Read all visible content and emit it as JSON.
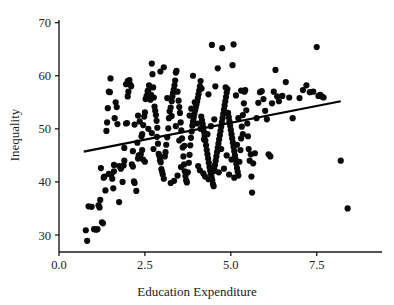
{
  "chart_data": {
    "type": "scatter",
    "title": "",
    "xlabel": "Education Expenditure",
    "ylabel": "Inequality",
    "xlim": [
      0.0,
      9.4
    ],
    "ylim": [
      26.8,
      70.5
    ],
    "xticks": [
      0.0,
      2.5,
      5.0,
      7.5
    ],
    "xticklabels": [
      "0.0",
      "2.5",
      "5.0",
      "7.5"
    ],
    "yticks": [
      30,
      40,
      50,
      60,
      70
    ],
    "yticklabels": [
      "30",
      "40",
      "50",
      "60",
      "70"
    ],
    "grid": false,
    "legend": null,
    "marker": {
      "shape": "circle",
      "color": "#0a0a0a",
      "size": 3.1
    },
    "trendline": {
      "type": "linear-fit",
      "color": "#000000",
      "x_start": 0.72,
      "y_start": 45.7,
      "x_end": 8.2,
      "y_end": 55.2,
      "slope": 1.27,
      "intercept": 44.79
    },
    "n_points": 301,
    "points": [
      [
        0.78,
        30.9
      ],
      [
        0.82,
        28.9
      ],
      [
        0.86,
        35.4
      ],
      [
        0.95,
        35.3
      ],
      [
        1.02,
        31.1
      ],
      [
        1.08,
        31.0
      ],
      [
        1.12,
        31.1
      ],
      [
        1.15,
        35.6
      ],
      [
        1.18,
        35.2
      ],
      [
        1.2,
        36.6
      ],
      [
        1.22,
        42.6
      ],
      [
        1.25,
        32.4
      ],
      [
        1.28,
        32.2
      ],
      [
        1.3,
        40.8
      ],
      [
        1.32,
        41.0
      ],
      [
        1.35,
        38.4
      ],
      [
        1.38,
        49.6
      ],
      [
        1.4,
        51.2
      ],
      [
        1.42,
        53.9
      ],
      [
        1.45,
        57.0
      ],
      [
        1.48,
        56.9
      ],
      [
        1.5,
        59.5
      ],
      [
        1.52,
        41.3
      ],
      [
        1.55,
        40.6
      ],
      [
        1.58,
        38.8
      ],
      [
        1.6,
        43.2
      ],
      [
        1.62,
        52.0
      ],
      [
        1.65,
        55.0
      ],
      [
        1.68,
        54.1
      ],
      [
        1.7,
        50.9
      ],
      [
        1.75,
        36.2
      ],
      [
        1.8,
        42.5
      ],
      [
        1.85,
        40.0
      ],
      [
        1.88,
        43.1
      ],
      [
        1.9,
        46.4
      ],
      [
        1.95,
        51.0
      ],
      [
        1.98,
        51.1
      ],
      [
        2.0,
        56.1
      ],
      [
        2.02,
        57.0
      ],
      [
        2.05,
        59.2
      ],
      [
        2.08,
        58.3
      ],
      [
        2.1,
        58.0
      ],
      [
        2.12,
        43.3
      ],
      [
        2.15,
        42.9
      ],
      [
        2.18,
        40.1
      ],
      [
        2.2,
        39.8
      ],
      [
        2.25,
        38.3
      ],
      [
        2.3,
        44.4
      ],
      [
        2.32,
        45.0
      ],
      [
        2.35,
        44.6
      ],
      [
        2.38,
        45.2
      ],
      [
        2.4,
        48.6
      ],
      [
        2.42,
        49.0
      ],
      [
        2.45,
        50.7
      ],
      [
        2.48,
        52.3
      ],
      [
        2.5,
        53.1
      ],
      [
        2.52,
        55.6
      ],
      [
        2.55,
        56.2
      ],
      [
        2.58,
        57.1
      ],
      [
        2.6,
        57.3
      ],
      [
        2.62,
        58.2
      ],
      [
        2.64,
        56.0
      ],
      [
        2.66,
        55.5
      ],
      [
        2.68,
        56.4
      ],
      [
        2.7,
        62.3
      ],
      [
        2.72,
        60.3
      ],
      [
        2.74,
        57.8
      ],
      [
        2.76,
        55.9
      ],
      [
        2.78,
        54.2
      ],
      [
        2.8,
        53.4
      ],
      [
        2.82,
        52.6
      ],
      [
        2.84,
        51.5
      ],
      [
        2.86,
        50.2
      ],
      [
        2.88,
        47.2
      ],
      [
        2.9,
        45.3
      ],
      [
        2.92,
        44.9
      ],
      [
        2.94,
        44.1
      ],
      [
        2.96,
        43.7
      ],
      [
        2.98,
        42.4
      ],
      [
        3.0,
        41.9
      ],
      [
        3.02,
        41.4
      ],
      [
        3.05,
        40.6
      ],
      [
        3.08,
        44.8
      ],
      [
        3.1,
        45.6
      ],
      [
        3.12,
        47.0
      ],
      [
        3.15,
        48.4
      ],
      [
        3.18,
        50.1
      ],
      [
        3.2,
        52.0
      ],
      [
        3.22,
        53.3
      ],
      [
        3.25,
        54.0
      ],
      [
        3.28,
        55.2
      ],
      [
        3.3,
        56.1
      ],
      [
        3.32,
        56.8
      ],
      [
        3.34,
        57.4
      ],
      [
        3.36,
        58.2
      ],
      [
        3.38,
        59.1
      ],
      [
        3.4,
        60.6
      ],
      [
        3.42,
        60.9
      ],
      [
        3.45,
        57.0
      ],
      [
        3.48,
        55.3
      ],
      [
        3.5,
        54.1
      ],
      [
        3.52,
        53.0
      ],
      [
        3.54,
        51.2
      ],
      [
        3.56,
        49.7
      ],
      [
        3.58,
        48.2
      ],
      [
        3.6,
        46.5
      ],
      [
        3.62,
        44.8
      ],
      [
        3.64,
        43.3
      ],
      [
        3.66,
        42.0
      ],
      [
        3.68,
        41.1
      ],
      [
        3.7,
        40.3
      ],
      [
        3.72,
        39.9
      ],
      [
        3.75,
        41.8
      ],
      [
        3.78,
        43.6
      ],
      [
        3.8,
        45.1
      ],
      [
        3.82,
        46.9
      ],
      [
        3.84,
        48.3
      ],
      [
        3.86,
        49.5
      ],
      [
        3.88,
        50.6
      ],
      [
        3.9,
        51.4
      ],
      [
        3.92,
        52.1
      ],
      [
        3.94,
        52.8
      ],
      [
        3.96,
        53.5
      ],
      [
        3.98,
        54.0
      ],
      [
        4.0,
        54.6
      ],
      [
        4.02,
        55.2
      ],
      [
        4.04,
        55.8
      ],
      [
        4.06,
        56.5
      ],
      [
        4.08,
        57.2
      ],
      [
        4.1,
        58.0
      ],
      [
        4.12,
        59.0
      ],
      [
        4.14,
        52.3
      ],
      [
        4.16,
        51.6
      ],
      [
        4.18,
        50.9
      ],
      [
        4.2,
        50.2
      ],
      [
        4.22,
        49.4
      ],
      [
        4.24,
        48.7
      ],
      [
        4.26,
        47.8
      ],
      [
        4.28,
        46.9
      ],
      [
        4.3,
        46.0
      ],
      [
        4.32,
        45.2
      ],
      [
        4.34,
        44.4
      ],
      [
        4.36,
        43.6
      ],
      [
        4.38,
        42.8
      ],
      [
        4.4,
        42.1
      ],
      [
        4.42,
        41.5
      ],
      [
        4.44,
        40.9
      ],
      [
        4.46,
        40.3
      ],
      [
        4.48,
        39.6
      ],
      [
        4.5,
        39.2
      ],
      [
        4.52,
        42.4
      ],
      [
        4.54,
        43.2
      ],
      [
        4.56,
        44.0
      ],
      [
        4.58,
        44.8
      ],
      [
        4.6,
        45.6
      ],
      [
        4.62,
        46.4
      ],
      [
        4.64,
        47.2
      ],
      [
        4.66,
        48.0
      ],
      [
        4.68,
        48.8
      ],
      [
        4.7,
        49.6
      ],
      [
        4.72,
        50.4
      ],
      [
        4.74,
        51.2
      ],
      [
        4.76,
        52.0
      ],
      [
        4.78,
        52.8
      ],
      [
        4.8,
        53.6
      ],
      [
        4.82,
        54.4
      ],
      [
        4.84,
        55.2
      ],
      [
        4.86,
        56.0
      ],
      [
        4.88,
        56.8
      ],
      [
        4.9,
        57.5
      ],
      [
        4.92,
        53.0
      ],
      [
        4.94,
        52.2
      ],
      [
        4.96,
        51.4
      ],
      [
        4.98,
        50.6
      ],
      [
        5.0,
        49.8
      ],
      [
        5.02,
        49.0
      ],
      [
        5.04,
        48.2
      ],
      [
        5.06,
        47.4
      ],
      [
        5.08,
        46.6
      ],
      [
        5.1,
        45.8
      ],
      [
        5.12,
        45.0
      ],
      [
        5.14,
        44.2
      ],
      [
        5.16,
        43.4
      ],
      [
        5.18,
        42.6
      ],
      [
        5.2,
        41.9
      ],
      [
        5.22,
        41.2
      ],
      [
        5.25,
        43.8
      ],
      [
        5.28,
        46.0
      ],
      [
        5.3,
        48.2
      ],
      [
        5.32,
        50.4
      ],
      [
        5.35,
        52.6
      ],
      [
        5.38,
        54.8
      ],
      [
        5.4,
        57.0
      ],
      [
        5.42,
        57.3
      ],
      [
        5.45,
        53.5
      ],
      [
        5.48,
        51.0
      ],
      [
        5.5,
        48.6
      ],
      [
        5.52,
        46.2
      ],
      [
        5.55,
        44.0
      ],
      [
        5.58,
        45.2
      ],
      [
        5.6,
        41.0
      ],
      [
        5.62,
        38.0
      ],
      [
        5.65,
        43.5
      ],
      [
        5.7,
        45.4
      ],
      [
        5.75,
        52.0
      ],
      [
        5.8,
        54.9
      ],
      [
        5.85,
        56.9
      ],
      [
        5.9,
        57.1
      ],
      [
        5.95,
        55.6
      ],
      [
        6.0,
        53.4
      ],
      [
        6.05,
        51.8
      ],
      [
        6.1,
        45.2
      ],
      [
        6.15,
        44.8
      ],
      [
        6.2,
        54.8
      ],
      [
        6.25,
        57.0
      ],
      [
        6.3,
        61.1
      ],
      [
        6.35,
        56.1
      ],
      [
        6.4,
        55.2
      ],
      [
        6.5,
        56.2
      ],
      [
        6.6,
        58.8
      ],
      [
        6.7,
        55.9
      ],
      [
        6.8,
        52.0
      ],
      [
        7.0,
        55.8
      ],
      [
        7.1,
        57.3
      ],
      [
        7.2,
        58.2
      ],
      [
        7.3,
        56.9
      ],
      [
        7.4,
        57.0
      ],
      [
        7.5,
        65.4
      ],
      [
        7.55,
        56.2
      ],
      [
        7.6,
        56.4
      ],
      [
        7.65,
        56.1
      ],
      [
        7.7,
        55.9
      ],
      [
        8.2,
        44.0
      ],
      [
        8.4,
        35.0
      ],
      [
        4.45,
        65.8
      ],
      [
        4.75,
        65.2
      ],
      [
        5.08,
        65.9
      ],
      [
        4.62,
        61.4
      ],
      [
        5.05,
        62.0
      ],
      [
        3.05,
        61.6
      ],
      [
        2.95,
        60.8
      ],
      [
        2.0,
        59.0
      ],
      [
        1.95,
        58.4
      ],
      [
        2.55,
        55.8
      ],
      [
        2.3,
        52.5
      ],
      [
        2.35,
        51.4
      ],
      [
        2.2,
        50.8
      ],
      [
        2.6,
        50.0
      ],
      [
        2.7,
        49.2
      ],
      [
        2.85,
        48.5
      ],
      [
        3.9,
        60.0
      ],
      [
        4.15,
        57.6
      ],
      [
        4.35,
        56.5
      ],
      [
        4.55,
        58.0
      ],
      [
        4.85,
        57.8
      ],
      [
        5.15,
        56.3
      ],
      [
        5.3,
        57.2
      ],
      [
        3.55,
        42.8
      ],
      [
        3.45,
        41.2
      ],
      [
        3.35,
        40.2
      ],
      [
        3.25,
        39.8
      ],
      [
        2.5,
        43.8
      ],
      [
        2.45,
        44.2
      ],
      [
        2.42,
        46.0
      ],
      [
        2.28,
        47.4
      ],
      [
        2.15,
        45.8
      ],
      [
        1.9,
        44.0
      ],
      [
        1.75,
        43.0
      ],
      [
        1.6,
        42.0
      ],
      [
        1.45,
        41.5
      ],
      [
        4.05,
        43.0
      ],
      [
        4.1,
        42.2
      ],
      [
        4.2,
        41.6
      ],
      [
        4.25,
        41.0
      ],
      [
        4.35,
        40.5
      ],
      [
        4.5,
        42.0
      ],
      [
        4.65,
        41.8
      ],
      [
        4.8,
        42.5
      ],
      [
        4.95,
        41.4
      ],
      [
        5.1,
        40.8
      ],
      [
        3.8,
        52.5
      ],
      [
        3.85,
        53.8
      ],
      [
        3.95,
        55.0
      ],
      [
        4.02,
        51.0
      ],
      [
        4.12,
        50.0
      ],
      [
        4.22,
        48.0
      ],
      [
        4.32,
        49.0
      ],
      [
        4.42,
        50.5
      ],
      [
        4.52,
        51.8
      ],
      [
        4.72,
        46.2
      ],
      [
        4.88,
        45.0
      ],
      [
        5.02,
        44.2
      ],
      [
        5.18,
        47.0
      ],
      [
        5.22,
        52.0
      ],
      [
        5.35,
        49.0
      ],
      [
        3.15,
        55.8
      ],
      [
        3.28,
        52.4
      ],
      [
        3.4,
        50.5
      ],
      [
        3.5,
        47.8
      ],
      [
        3.65,
        46.8
      ],
      [
        2.75,
        46.2
      ]
    ]
  },
  "axis": {
    "x_title": "Education Expenditure",
    "y_title": "Inequality"
  }
}
